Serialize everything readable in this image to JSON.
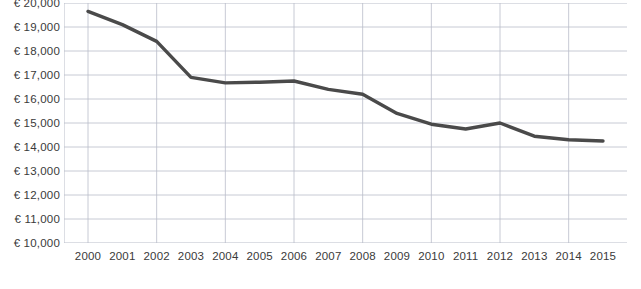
{
  "chart_data": {
    "type": "line",
    "title": "",
    "subtitle": "",
    "xlabel": "",
    "ylabel": "",
    "x": [
      2000,
      2001,
      2002,
      2003,
      2004,
      2005,
      2006,
      2007,
      2008,
      2009,
      2010,
      2011,
      2012,
      2013,
      2014,
      2015
    ],
    "categories": [
      "2000",
      "2001",
      "2002",
      "2003",
      "2004",
      "2005",
      "2006",
      "2007",
      "2008",
      "2009",
      "2010",
      "2011",
      "2012",
      "2013",
      "2014",
      "2015"
    ],
    "values": [
      19650,
      19100,
      18400,
      16900,
      16670,
      16700,
      16750,
      16400,
      16200,
      15400,
      14950,
      14750,
      15000,
      14450,
      14300,
      14250
    ],
    "series": [
      {
        "name": "",
        "values": [
          19650,
          19100,
          18400,
          16900,
          16670,
          16700,
          16750,
          16400,
          16200,
          15400,
          14950,
          14750,
          15000,
          14450,
          14300,
          14250
        ]
      }
    ],
    "ylim": [
      10000,
      20000
    ],
    "xlim": [
      2000,
      2015
    ],
    "y_ticks": [
      10000,
      11000,
      12000,
      13000,
      14000,
      15000,
      16000,
      17000,
      18000,
      19000,
      20000
    ],
    "y_tick_labels": [
      "€ 10,000",
      "€ 11,000",
      "€ 12,000",
      "€ 13,000",
      "€ 14,000",
      "€ 15,000",
      "€ 16,000",
      "€ 17,000",
      "€ 18,000",
      "€ 19,000",
      "€ 20,000"
    ],
    "x_tick_labels": [
      "2000",
      "2001",
      "2002",
      "2003",
      "2004",
      "2005",
      "2006",
      "2007",
      "2008",
      "2009",
      "2010",
      "2011",
      "2012",
      "2013",
      "2014",
      "2015"
    ],
    "grid": {
      "horizontal": true,
      "vertical": true,
      "color": "#b9bdc9"
    },
    "legend": {
      "visible": false,
      "position": "none",
      "entries": []
    },
    "annotations": [],
    "colors": {
      "line": "#4a4a4a",
      "grid": "#b9bdc9",
      "axis": "#8e8e8e",
      "tick_label": "#3a3a3a",
      "background": "#ffffff"
    },
    "line_width": 3.4,
    "currency_symbol": "€"
  },
  "caption": {
    "cut_off_text": ""
  }
}
